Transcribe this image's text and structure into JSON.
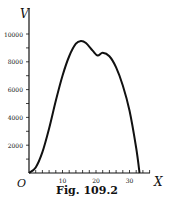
{
  "chart_data": {
    "type": "line",
    "title": "",
    "caption": "Fig. 109.2",
    "xlabel": "X",
    "ylabel": "V",
    "origin_label": "O",
    "xlim": [
      0,
      35
    ],
    "ylim": [
      0,
      11000
    ],
    "x_ticks": [
      10,
      20,
      30
    ],
    "y_ticks": [
      2000,
      4000,
      6000,
      8000,
      10000
    ],
    "y_tick_labels": [
      "2000",
      "4000",
      "6000",
      "8000",
      "10000"
    ],
    "x_tick_labels": [
      "10",
      "20",
      "30"
    ],
    "grid": false,
    "series": [
      {
        "name": "V",
        "x": [
          0,
          2,
          4,
          6,
          8,
          10,
          12,
          14,
          15.5,
          17,
          19,
          20.5,
          22,
          24,
          26,
          28,
          30,
          32,
          33
        ],
        "y": [
          0,
          400,
          1500,
          3200,
          5200,
          7000,
          8400,
          9300,
          9500,
          9350,
          8800,
          8450,
          8650,
          8400,
          7600,
          6300,
          4500,
          1800,
          0
        ]
      }
    ]
  }
}
